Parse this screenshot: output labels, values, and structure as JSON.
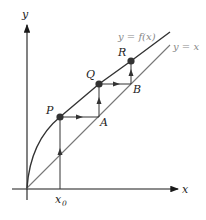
{
  "diagram": {
    "axes": {
      "x_label": "x",
      "y_label": "y"
    },
    "curves": {
      "f_label": "y = f(x)",
      "identity_label": "y = x"
    },
    "points": {
      "P": "P",
      "Q": "Q",
      "R": "R",
      "A": "A",
      "B": "B"
    },
    "tick": {
      "x0_base": "x",
      "x0_sub": "0"
    },
    "colors": {
      "axis": "#1a1a1a",
      "curve": "#333333",
      "identity": "#777777",
      "point": "#333333",
      "label_gray": "#888888"
    }
  }
}
